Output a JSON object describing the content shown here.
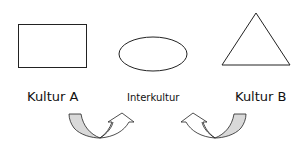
{
  "diagram": {
    "shapes": [
      {
        "type": "rectangle",
        "culture": "Kultur A"
      },
      {
        "type": "ellipse",
        "culture": "Interkultur"
      },
      {
        "type": "triangle",
        "culture": "Kultur B"
      }
    ],
    "labels": {
      "kultur_a": "Kultur A",
      "interkultur": "Interkultur",
      "kultur_b": "Kultur B"
    },
    "arrows": [
      {
        "side": "left",
        "description": "Curved arrow from Kultur A toward Interkultur"
      },
      {
        "side": "right",
        "description": "Curved arrow from Kultur B toward Interkultur"
      }
    ],
    "colors": {
      "stroke": "#222222",
      "arrow_fill": "#d9d9d9",
      "background": "#ffffff"
    }
  }
}
